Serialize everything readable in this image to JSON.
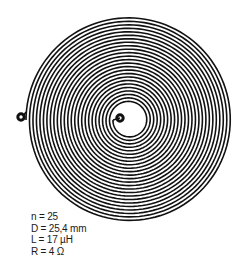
{
  "diagram": {
    "type": "planar-spiral-coil",
    "turns": 25,
    "stroke_color": "#111111",
    "background": "#ffffff",
    "center": [
      129,
      120
    ],
    "outer_radius": 103,
    "inner_radius": 16,
    "terminals": [
      {
        "name": "outer-terminal",
        "x": 21,
        "y": 117
      },
      {
        "name": "inner-terminal",
        "x": 120,
        "y": 118
      }
    ]
  },
  "specs": {
    "n": "n = 25",
    "D": "D = 25,4 mm",
    "L": "L = 17 µH",
    "R": "R = 4 Ω"
  }
}
